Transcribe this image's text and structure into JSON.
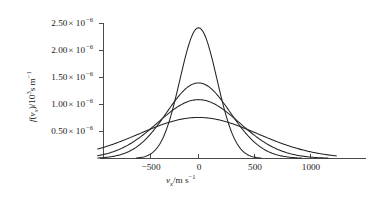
{
  "chart_data": {
    "type": "line",
    "title": "",
    "subtitle": "",
    "xlabel": "v_x / m s^-1",
    "ylabel": "f(v_x) / 10^3 s m^-1",
    "xlim": [
      -900,
      1230
    ],
    "ylim": [
      0,
      2.65e-06
    ],
    "grid": false,
    "legend": "none",
    "xticks": [
      -500,
      0,
      500,
      1000
    ],
    "xtick_labels": [
      "−500",
      "0",
      "500",
      "1000"
    ],
    "yticks": [
      5e-07,
      1e-06,
      1.5e-06,
      2e-06,
      2.5e-06
    ],
    "ytick_labels": [
      "0.50",
      "1.00",
      "1.50",
      "2.00",
      "2.50"
    ],
    "ytick_mantissa_suffix": "× 10",
    "ytick_exponent": "−6",
    "annotations": [],
    "series": [
      {
        "name": "curve-1-narrowest",
        "peak_value": 2.42e-06,
        "peak_x": 0,
        "sigma": 165,
        "description": "tallest narrowest Gaussian"
      },
      {
        "name": "curve-2",
        "peak_value": 1.4e-06,
        "peak_x": 0,
        "sigma": 285,
        "description": "second tallest Gaussian"
      },
      {
        "name": "curve-3",
        "peak_value": 1.09e-06,
        "peak_x": 0,
        "sigma": 366,
        "description": "third Gaussian"
      },
      {
        "name": "curve-4-broadest",
        "peak_value": 7.6e-07,
        "peak_x": 0,
        "sigma": 525,
        "description": "lowest broadest Gaussian"
      }
    ]
  },
  "axes": {
    "y_title_main": "f",
    "y_title_paren_open": "(",
    "y_title_v": "v",
    "y_title_v_sub": "x",
    "y_title_paren_close": ")",
    "y_title_divider": "/10",
    "y_title_exp": "3",
    "y_title_units": "s m",
    "y_title_units_exp": "−1",
    "x_title_v": "v",
    "x_title_v_sub": "x",
    "x_title_divider": "/m s",
    "x_title_units_exp": "−1"
  },
  "style": {
    "curve_color": "#232323",
    "axis_color": "#4a4a4a",
    "text_color": "#1a1a1a",
    "background": "#ffffff"
  }
}
